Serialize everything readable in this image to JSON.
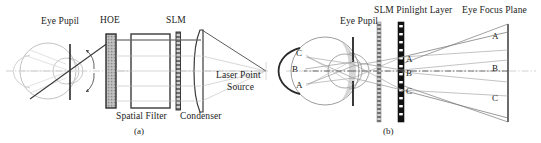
{
  "figure": {
    "width": 541,
    "height": 143,
    "background": "#ffffff",
    "ink_dark": "#1b1b1b",
    "ink_gray": "#9a9a9a",
    "ink_light": "#bcbcbc"
  },
  "panel_a": {
    "caption": "(a)",
    "labels": {
      "eye_pupil": "Eye Pupil",
      "hoe": "HOE",
      "slm": "SLM",
      "spatial_filter": "Spatial Filter",
      "condenser": "Condenser",
      "laser_line1": "Laser Point",
      "laser_line2": "Source"
    }
  },
  "panel_b": {
    "caption": "(b)",
    "labels": {
      "eye_pupil": "Eye Pupil",
      "slm_pinlight_layer": "SLM Pinlight Layer",
      "eye_focus_plane": "Eye Focus Plane"
    },
    "retina_points": [
      "C",
      "B",
      "A"
    ],
    "pinlight_points": [
      "A",
      "B",
      "C"
    ],
    "focus_plane_points": [
      "A",
      "B",
      "C"
    ]
  }
}
